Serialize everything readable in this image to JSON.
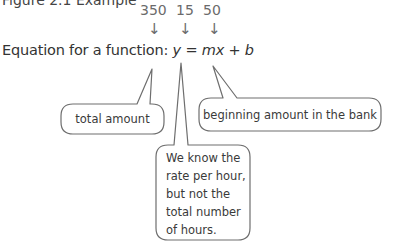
{
  "cut_off_line": "Figure 2.1 Example",
  "values": [
    {
      "label": "350",
      "x": 140
    },
    {
      "label": "15",
      "x": 176
    },
    {
      "label": "50",
      "x": 203
    }
  ],
  "arrow_glyph": "↓",
  "equation": {
    "prefix": "Equation for a function: ",
    "y": "y",
    "eq": " = ",
    "mx": "mx",
    "plus": " + ",
    "b": "b"
  },
  "callouts": {
    "y": "total amount",
    "b": "beginning amount in the bank",
    "mx_lines": [
      "We know the",
      "rate per hour,",
      "but not the",
      "total number",
      "of hours."
    ]
  },
  "colors": {
    "stroke": "#6e6e6e",
    "value_text": "#6b6b6b",
    "body_text": "#3a3a3a"
  }
}
